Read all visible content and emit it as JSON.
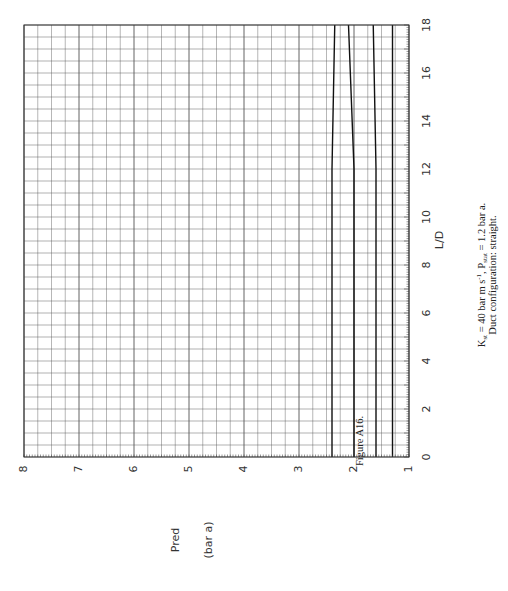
{
  "chart_data": {
    "type": "line",
    "orientation": "rotated-90-clockwise",
    "title": "",
    "xlabel": "L/D",
    "ylabel": "Pred (bar a)",
    "ylabel_line1": "Pred",
    "ylabel_line2": "(bar a)",
    "xlim": [
      0,
      18
    ],
    "ylim": [
      1,
      8
    ],
    "x_ticks": [
      0,
      2,
      4,
      6,
      8,
      10,
      12,
      14,
      16,
      18
    ],
    "y_ticks": [
      1,
      2,
      3,
      4,
      5,
      6,
      7,
      8
    ],
    "x_tick_labels": [
      "0",
      "2",
      "4",
      "6",
      "8",
      "10",
      "12",
      "14",
      "16",
      "18"
    ],
    "y_tick_labels": [
      "1",
      "2",
      "3",
      "4",
      "5",
      "6",
      "7",
      "8"
    ],
    "grid": true,
    "grid_minor_x": 0.5,
    "grid_minor_y": 0.25,
    "legend": null,
    "series": [
      {
        "name": "curve-1",
        "x": [
          0,
          6,
          12,
          18
        ],
        "values": [
          2.4,
          2.4,
          2.4,
          2.35
        ]
      },
      {
        "name": "curve-2",
        "x": [
          0,
          6,
          12,
          18
        ],
        "values": [
          2.0,
          2.0,
          2.0,
          2.1
        ]
      },
      {
        "name": "curve-3",
        "x": [
          0,
          6,
          12,
          18
        ],
        "values": [
          1.6,
          1.6,
          1.6,
          1.65
        ]
      },
      {
        "name": "curve-4",
        "x": [
          0,
          6,
          12,
          18
        ],
        "values": [
          1.3,
          1.3,
          1.3,
          1.3
        ]
      }
    ],
    "caption": {
      "figure_label": "Figure A16.",
      "line1_prefix": "K",
      "line1_sub1": "st",
      "line1_mid": " = 40 bar m s",
      "line1_sup": "-1",
      "line1_mid2": ", P",
      "line1_sub2": "stat",
      "line1_end": " = 1.2 bar a.",
      "line2": "Duct configuration:  straight."
    }
  },
  "colors": {
    "grid": "#555555",
    "frame": "#333333",
    "curve": "#111111",
    "text": "#222222"
  }
}
